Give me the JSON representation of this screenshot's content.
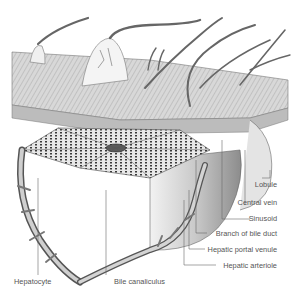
{
  "diagram": {
    "labels": [
      {
        "id": "lobule",
        "text": "Lobule"
      },
      {
        "id": "central-vein",
        "text": "Central vein"
      },
      {
        "id": "sinusoid",
        "text": "Sinusoid"
      },
      {
        "id": "branch-bile-duct",
        "text": "Branch of bile duct"
      },
      {
        "id": "hepatic-portal-venule",
        "text": "Hepatic portal venule"
      },
      {
        "id": "hepatic-arteriole",
        "text": "Hepatic arteriole"
      },
      {
        "id": "hepatocyte",
        "text": "Hepatocyte"
      },
      {
        "id": "bile-canaliculus",
        "text": "Bile canaliculus"
      }
    ],
    "colors": {
      "line": "#555555",
      "tissue_light": "#e6e6e6",
      "tissue_mid": "#b5b5b5",
      "tissue_dark": "#4a4a4a"
    }
  }
}
